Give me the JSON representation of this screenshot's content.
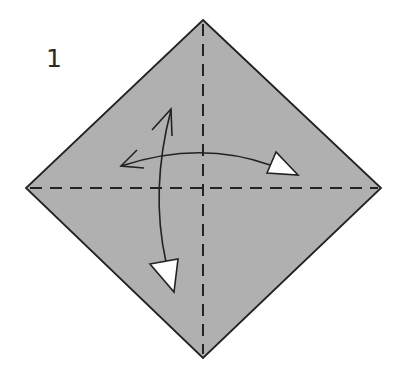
{
  "step": {
    "number": "1"
  },
  "colors": {
    "paper": "#b0b0b0",
    "outline": "#222222",
    "arrowhead_fill": "#ffffff",
    "background": "#ffffff"
  },
  "diagram": {
    "shape": "square rotated 45° (diamond)",
    "folds": [
      {
        "type": "valley-fold",
        "direction": "vertical diagonal"
      },
      {
        "type": "valley-fold",
        "direction": "horizontal diagonal"
      }
    ],
    "arrows": [
      {
        "type": "fold-and-unfold",
        "direction": "left-to-right"
      },
      {
        "type": "fold-and-unfold",
        "direction": "top-to-bottom"
      }
    ]
  }
}
